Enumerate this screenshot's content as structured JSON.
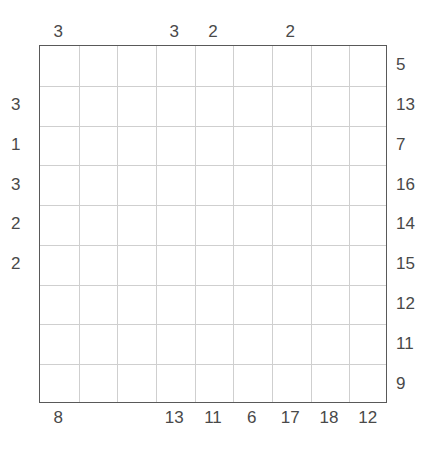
{
  "puzzle": {
    "title": "Grid Puzzle",
    "grid": {
      "columns": 9,
      "rows": 9,
      "cell_values": [
        [
          "",
          "",
          "",
          "",
          "",
          "",
          "",
          "",
          ""
        ],
        [
          "",
          "",
          "",
          "",
          "",
          "",
          "",
          "",
          ""
        ],
        [
          "",
          "",
          "",
          "",
          "",
          "",
          "",
          "",
          ""
        ],
        [
          "",
          "",
          "",
          "",
          "",
          "",
          "",
          "",
          ""
        ],
        [
          "",
          "",
          "",
          "",
          "",
          "",
          "",
          "",
          ""
        ],
        [
          "",
          "",
          "",
          "",
          "",
          "",
          "",
          "",
          ""
        ],
        [
          "",
          "",
          "",
          "",
          "",
          "",
          "",
          "",
          ""
        ],
        [
          "",
          "",
          "",
          "",
          "",
          "",
          "",
          "",
          ""
        ],
        [
          "",
          "",
          "",
          "",
          "",
          "",
          "",
          "",
          ""
        ]
      ]
    },
    "clues": {
      "top": [
        "3",
        "",
        "",
        "3",
        "2",
        "",
        "2",
        "",
        ""
      ],
      "bottom": [
        "8",
        "",
        "",
        "13",
        "11",
        "6",
        "17",
        "18",
        "12"
      ],
      "left": [
        "",
        "3",
        "1",
        "3",
        "2",
        "2",
        "",
        "",
        ""
      ],
      "right": [
        "5",
        "13",
        "7",
        "16",
        "14",
        "15",
        "12",
        "11",
        "9"
      ]
    },
    "colors": {
      "border": "#595959",
      "gridline": "#cfcfcf",
      "text": "#494949",
      "background": "#ffffff"
    }
  }
}
